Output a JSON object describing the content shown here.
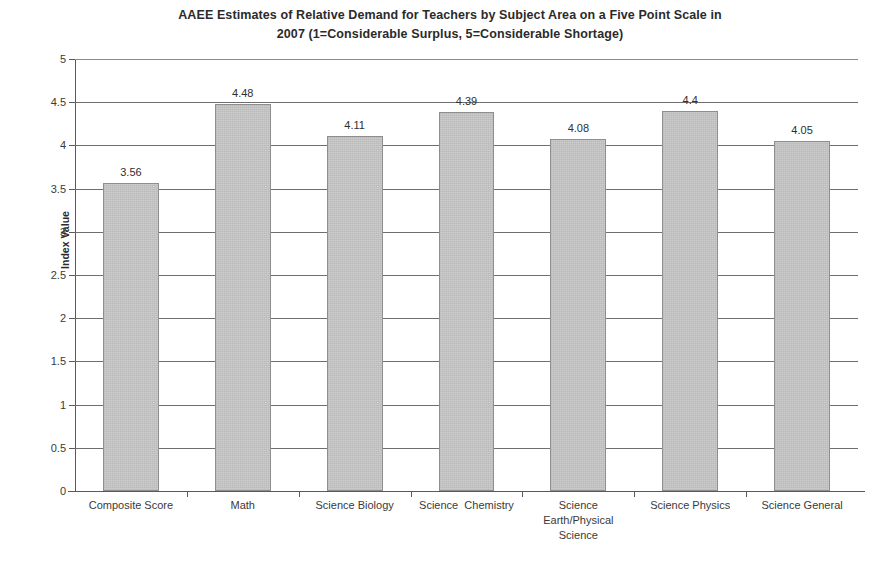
{
  "chart_data": {
    "type": "bar",
    "title": "AAEE Estimates of Relative Demand for Teachers by Subject Area on a Five Point Scale in 2007 (1=Considerable Surplus, 5=Considerable Shortage)",
    "title_lines": [
      "AAEE Estimates of Relative Demand for Teachers by Subject Area on a Five Point Scale in",
      "2007 (1=Considerable Surplus, 5=Considerable Shortage)"
    ],
    "xlabel": "",
    "ylabel": "Index Value",
    "ylim": [
      0,
      5
    ],
    "ytick_step": 0.5,
    "yticks": [
      "5",
      "4.5",
      "4",
      "3.5",
      "3",
      "2.5",
      "2",
      "1.5",
      "1",
      "0.5",
      "0"
    ],
    "ytick_values": [
      5,
      4.5,
      4,
      3.5,
      3,
      2.5,
      2,
      1.5,
      1,
      0.5,
      0
    ],
    "grid": true,
    "legend": false,
    "categories": [
      "Composite Score",
      "Math",
      "Science Biology",
      "Science  Chemistry",
      "Science Earth/Physical Science",
      "Science Physics",
      "Science General"
    ],
    "category_label_lines": [
      [
        "Composite Score"
      ],
      [
        "Math"
      ],
      [
        "Science Biology"
      ],
      [
        "Science  Chemistry"
      ],
      [
        "Science",
        "Earth/Physical",
        "Science"
      ],
      [
        "Science Physics"
      ],
      [
        "Science General"
      ]
    ],
    "values": [
      3.56,
      4.48,
      4.11,
      4.39,
      4.08,
      4.4,
      4.05
    ],
    "data_labels": [
      "3.56",
      "4.48",
      "4.11",
      "4.39",
      "4.08",
      "4.4",
      "4.05"
    ],
    "bar_fill_color": "#c9c9c9",
    "bar_border_color": "#8e8e8e",
    "gridline_color": "#6f6f6f",
    "axis_color": "#5a5a5a",
    "background_color": "#ffffff",
    "text_color": "#333333"
  }
}
